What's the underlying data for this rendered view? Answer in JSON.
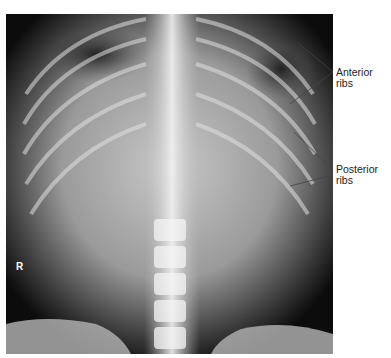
{
  "image": {
    "subject": "Abdominal radiograph (AP view) showing ribs, lumbar spine and iliac crests",
    "side_marker": "R"
  },
  "annotations": [
    {
      "label": "Anterior ribs"
    },
    {
      "label": "Posterior",
      "label_line2": "ribs"
    }
  ]
}
